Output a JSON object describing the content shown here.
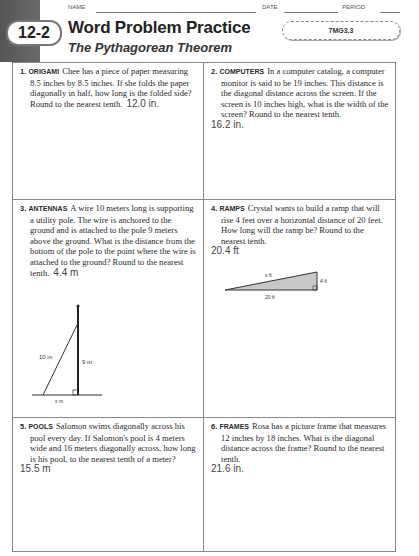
{
  "header": {
    "name_label": "NAME",
    "date_label": "DATE",
    "period_label": "PERIOD",
    "lesson_badge": "12-2",
    "title": "Word Problem Practice",
    "subtitle": "The Pythagorean Theorem",
    "standard": "7MG3.3"
  },
  "problems": [
    {
      "number": "1.",
      "keyword": "ORIGAMI",
      "text": "Chee has a piece of paper measuring 8.5 inches by 8.5 inches. If she folds the paper diagonally in half, how long is the folded side? Round to the nearest tenth.",
      "answer": "12.0 in."
    },
    {
      "number": "2.",
      "keyword": "COMPUTERS",
      "text": "In a computer catalog, a computer monitor is said to be 19 inches. This distance is the diagonal distance across the screen. If the screen is 10 inches high, what is the width of the screen? Round to the nearest tenth.",
      "answer": "16.2 in."
    },
    {
      "number": "3.",
      "keyword": "ANTENNAS",
      "text": "A wire 10 meters long is supporting a utility pole. The wire is anchored to the ground and is attached to the pole 9 meters above the ground. What is the distance from the bottom of the pole to the point where the wire is attached to the ground? Round to the nearest tenth.",
      "answer": "4.4 m",
      "figure": {
        "hyp_label": "10 m",
        "height_label": "9 m",
        "base_label": "x m"
      }
    },
    {
      "number": "4.",
      "keyword": "RAMPS",
      "text": "Crystal wants to build a ramp that will rise 4 feet over a horizontal distance of 20 feet. How long will the ramp be? Round to the nearest tenth.",
      "answer": "20.4 ft",
      "figure": {
        "hyp_label": "x ft",
        "height_label": "4 ft",
        "base_label": "20 ft"
      }
    },
    {
      "number": "5.",
      "keyword": "POOLS",
      "text": "Salomon swims diagonally across his pool every day. If Salomon's pool is 4 meters wide and 16 meters diagonally across, how long is his pool, to the nearest tenth of a meter?",
      "answer": "15.5 m"
    },
    {
      "number": "6.",
      "keyword": "FRAMES",
      "text": "Rosa has a picture frame that measures 12 inches by 18 inches. What is the diagonal distance across the frame? Round to the nearest tenth.",
      "answer": "21.6 in."
    }
  ]
}
